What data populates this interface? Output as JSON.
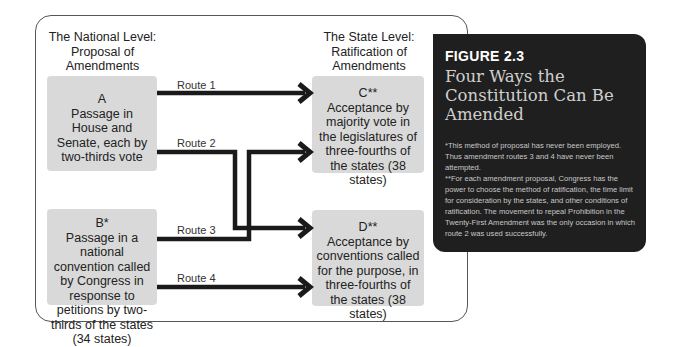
{
  "diagram": {
    "left_heading": "The National Level:\nProposal of\nAmendments",
    "right_heading": "The State Level:\nRatification of\nAmendments",
    "boxes": {
      "A": {
        "letter": "A",
        "text": "Passage in House and Senate, each by two-thirds vote"
      },
      "B": {
        "letter": "B*",
        "text": "Passage in a national convention called by Congress in response to petitions by two-thirds of the states (34 states)"
      },
      "C": {
        "letter": "C**",
        "text": "Acceptance by majority vote in the legislatures of three-fourths of the states (38 states)"
      },
      "D": {
        "letter": "D**",
        "text": "Acceptance by conventions called for the purpose, in three-fourths of the states (38 states)"
      }
    },
    "routes": [
      {
        "label": "Route 1",
        "from": "A",
        "to": "C"
      },
      {
        "label": "Route 2",
        "from": "A",
        "to": "D"
      },
      {
        "label": "Route 3",
        "from": "B",
        "to": "C"
      },
      {
        "label": "Route 4",
        "from": "B",
        "to": "D"
      }
    ],
    "colors": {
      "box": "#d9d9d9",
      "line": "#1a1a1a",
      "panel": "#1f1f1f"
    }
  },
  "figure": {
    "number": "FIGURE 2.3",
    "title": "Four Ways the Constitution Can Be Amended",
    "note1": "*This method of proposal has never been employed. Thus amendment routes 3 and 4 have never been attempted.",
    "note2": "**For each amendment proposal, Congress has the power to choose the method of ratification, the time limit for consideration by the states, and other conditions of ratification. The movement to repeal Prohibition in the Twenty-First Amendment was the only occasion in which route 2 was used successfully."
  }
}
